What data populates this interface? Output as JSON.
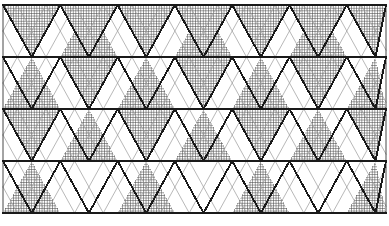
{
  "figure": {
    "canvas": {
      "width": 389,
      "height": 226
    },
    "background_color": "#ffffff"
  },
  "geometry": {
    "origin_x": 3,
    "origin_y": 5,
    "cell_width": 57.3,
    "row_height": 52,
    "columns": 7,
    "rows": 4,
    "pattern_right": 386,
    "pattern_bottom": 213
  },
  "style": {
    "bold_line_color": "#1a1a1a",
    "bold_line_width": 1.9,
    "thin_line_color": "#9a9a9a",
    "thin_line_width": 0.7,
    "hatch_line_color": "#4a4a4a",
    "hatch_line_width": 0.6,
    "hatch_spacing": 2.6,
    "fill_background": "#ffffff"
  },
  "chart_data": {
    "type": "diagram",
    "motif": "alternating crosshatched and blank isoceles triangles forming a diamond lattice",
    "legend": [
      {
        "key": "filled",
        "label": "Crosshatched triangle",
        "color": "#4a4a4a"
      },
      {
        "key": "blank",
        "label": "Blank triangle",
        "color": "#ffffff"
      }
    ],
    "notes": [
      "Bold dark diagonals delineate the primary diamond lattice.",
      "Thin gray diagonals form an offset secondary lattice creating inner diamonds.",
      "Fill parity alternates per row so up-pointing and down-pointing triangles swap shading."
    ],
    "rows": [
      {
        "index": 0,
        "up_filled": [
          false,
          true,
          false,
          true,
          false,
          true,
          false
        ],
        "down_filled": [
          true,
          true,
          true,
          true,
          true,
          true,
          true
        ]
      },
      {
        "index": 1,
        "up_filled": [
          true,
          false,
          true,
          false,
          true,
          false,
          true
        ],
        "down_filled": [
          false,
          true,
          false,
          true,
          false,
          true,
          false
        ]
      },
      {
        "index": 2,
        "up_filled": [
          false,
          true,
          false,
          true,
          false,
          true,
          false
        ],
        "down_filled": [
          true,
          false,
          true,
          false,
          true,
          false,
          true
        ]
      },
      {
        "index": 3,
        "up_filled": [
          true,
          false,
          true,
          false,
          true,
          false,
          true
        ],
        "down_filled": [
          false,
          false,
          false,
          false,
          false,
          false,
          false
        ]
      }
    ]
  }
}
